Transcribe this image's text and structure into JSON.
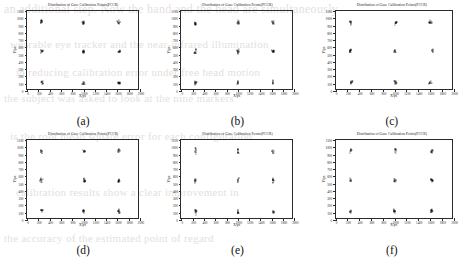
{
  "figure": {
    "caption_letters": [
      "(a)",
      "(b)",
      "(c)",
      "(d)",
      "(e)",
      "(f)"
    ],
    "panel_count": 6,
    "background_text_lines": [
      "an additional step. Now the hand and the head are simultaneously",
      "wearable eye tracker and the near-infrared illumination",
      "in reducing calibration error under free head motion",
      "the subject was asked to look at the nine markers",
      "is the root mean square error for each configuration",
      "calibration results show a clear improvement in",
      "the accuracy of the estimated point of regard"
    ]
  },
  "chart_data": [
    {
      "type": "scatter",
      "panel": "(a)",
      "title": "Distribution of Gaze Calibration Points(PCCR)",
      "xlabel": "X/px",
      "ylabel": "Y/px",
      "xlim": [
        0,
        2000
      ],
      "ylim": [
        0,
        1100
      ],
      "xticks": [
        0,
        200,
        400,
        600,
        800,
        1000,
        1200,
        1400,
        1600,
        1800,
        2000
      ],
      "yticks": [
        0,
        100,
        200,
        300,
        400,
        500,
        600,
        700,
        800,
        900,
        1000,
        1100
      ],
      "grid": false,
      "legend": "none",
      "marker": "dot",
      "color": "#111111",
      "cluster_centers": [
        [
          260,
          950
        ],
        [
          1000,
          950
        ],
        [
          1620,
          950
        ],
        [
          255,
          550
        ],
        [
          1000,
          545
        ],
        [
          1630,
          545
        ],
        [
          265,
          120
        ],
        [
          1000,
          110
        ],
        [
          1630,
          115
        ]
      ],
      "cluster_spread": [
        22,
        26
      ],
      "points_per_cluster": 9
    },
    {
      "type": "scatter",
      "panel": "(b)",
      "title": "Distribution of Gaze Calibration Points(PCCR)",
      "xlabel": "X/px",
      "ylabel": "Y/px",
      "xlim": [
        0,
        2000
      ],
      "ylim": [
        0,
        1100
      ],
      "xticks": [
        0,
        200,
        400,
        600,
        800,
        1000,
        1200,
        1400,
        1600,
        1800,
        2000
      ],
      "yticks": [
        0,
        100,
        200,
        300,
        400,
        500,
        600,
        700,
        800,
        900,
        1000,
        1100
      ],
      "grid": false,
      "legend": "none",
      "marker": "dot",
      "color": "#111111",
      "cluster_centers": [
        [
          250,
          940
        ],
        [
          1010,
          950
        ],
        [
          1620,
          945
        ],
        [
          245,
          545
        ],
        [
          1000,
          545
        ],
        [
          1625,
          545
        ],
        [
          250,
          120
        ],
        [
          1000,
          120
        ],
        [
          1620,
          120
        ]
      ],
      "cluster_spread": [
        16,
        30
      ],
      "points_per_cluster": 9
    },
    {
      "type": "scatter",
      "panel": "(c)",
      "title": "Distribution of Gaze Calibration Points(PCCR)",
      "xlabel": "X/px",
      "ylabel": "Y/px",
      "xlim": [
        0,
        2000
      ],
      "ylim": [
        0,
        1100
      ],
      "xticks": [
        0,
        200,
        400,
        600,
        800,
        1000,
        1200,
        1400,
        1600,
        1800,
        2000
      ],
      "yticks": [
        0,
        100,
        200,
        300,
        400,
        500,
        600,
        700,
        800,
        900,
        1000,
        1100
      ],
      "grid": false,
      "legend": "none",
      "marker": "dot",
      "color": "#111111",
      "cluster_centers": [
        [
          255,
          945
        ],
        [
          1020,
          945
        ],
        [
          1610,
          945
        ],
        [
          250,
          550
        ],
        [
          1010,
          550
        ],
        [
          1640,
          555
        ],
        [
          265,
          125
        ],
        [
          1010,
          115
        ],
        [
          1605,
          115
        ]
      ],
      "cluster_spread": [
        20,
        28
      ],
      "points_per_cluster": 9
    },
    {
      "type": "scatter",
      "panel": "(d)",
      "title": "Distribution of Gaze Calibration Points(PCCR)",
      "xlabel": "X/px",
      "ylabel": "Y/px",
      "xlim": [
        0,
        2000
      ],
      "ylim": [
        0,
        1100
      ],
      "xticks": [
        0,
        200,
        400,
        600,
        800,
        1000,
        1200,
        1400,
        1600,
        1800,
        2000
      ],
      "yticks": [
        0,
        100,
        200,
        300,
        400,
        500,
        600,
        700,
        800,
        900,
        1000,
        1100
      ],
      "grid": false,
      "legend": "none",
      "marker": "dot",
      "color": "#111111",
      "cluster_centers": [
        [
          255,
          945
        ],
        [
          1010,
          950
        ],
        [
          1625,
          950
        ],
        [
          250,
          550
        ],
        [
          1010,
          550
        ],
        [
          1635,
          550
        ],
        [
          260,
          125
        ],
        [
          1010,
          120
        ],
        [
          1625,
          120
        ]
      ],
      "cluster_spread": [
        20,
        26
      ],
      "points_per_cluster": 9
    },
    {
      "type": "scatter",
      "panel": "(e)",
      "title": "Distribution of Gaze Calibration Points(PCCR)",
      "xlabel": "X/px",
      "ylabel": "Y/px",
      "xlim": [
        0,
        2000
      ],
      "ylim": [
        0,
        1100
      ],
      "xticks": [
        0,
        200,
        400,
        600,
        800,
        1000,
        1200,
        1400,
        1600,
        1800,
        2000
      ],
      "yticks": [
        0,
        100,
        200,
        300,
        400,
        500,
        600,
        700,
        800,
        900,
        1000,
        1100
      ],
      "grid": false,
      "legend": "none",
      "marker": "dot",
      "color": "#111111",
      "cluster_centers": [
        [
          255,
          945
        ],
        [
          1005,
          950
        ],
        [
          1625,
          945
        ],
        [
          250,
          550
        ],
        [
          1010,
          555
        ],
        [
          1625,
          550
        ],
        [
          255,
          120
        ],
        [
          1005,
          120
        ],
        [
          1630,
          120
        ]
      ],
      "cluster_spread": [
        14,
        36
      ],
      "points_per_cluster": 9
    },
    {
      "type": "scatter",
      "panel": "(f)",
      "title": "Distribution of Gaze Calibration Points(PCCR)",
      "xlabel": "X/px",
      "ylabel": "Y/px",
      "xlim": [
        0,
        2000
      ],
      "ylim": [
        0,
        1100
      ],
      "xticks": [
        0,
        200,
        400,
        600,
        800,
        1000,
        1200,
        1400,
        1600,
        1800,
        2000
      ],
      "yticks": [
        0,
        100,
        200,
        300,
        400,
        500,
        600,
        700,
        800,
        900,
        1000,
        1100
      ],
      "grid": false,
      "legend": "none",
      "marker": "dot",
      "color": "#111111",
      "cluster_centers": [
        [
          260,
          950
        ],
        [
          1010,
          950
        ],
        [
          1630,
          950
        ],
        [
          250,
          550
        ],
        [
          1005,
          550
        ],
        [
          1630,
          550
        ],
        [
          255,
          120
        ],
        [
          1005,
          120
        ],
        [
          1625,
          125
        ]
      ],
      "cluster_spread": [
        16,
        30
      ],
      "points_per_cluster": 9
    }
  ]
}
